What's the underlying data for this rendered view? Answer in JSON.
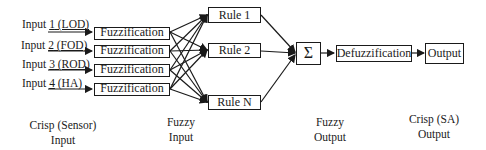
{
  "inputs": [
    {
      "prefix": "Input ",
      "num": "1",
      "tag": " (LOD)"
    },
    {
      "prefix": "Input ",
      "num": "2",
      "tag": " (FOD)"
    },
    {
      "prefix": "Input ",
      "num": "3",
      "tag": " (ROD)"
    },
    {
      "prefix": "Input ",
      "num": "4",
      "tag": " (HA)"
    }
  ],
  "fuzzification": [
    "Fuzzification",
    "Fuzzification",
    "Fuzzification",
    "Fuzzification"
  ],
  "rules": [
    "Rule 1",
    "Rule 2",
    "Rule N"
  ],
  "sum_symbol": "Σ",
  "defuzzification": "Defuzzification",
  "output": "Output",
  "captions": {
    "crisp_input_1": "Crisp (Sensor)",
    "crisp_input_2": "Input",
    "fuzzy_input_1": "Fuzzy",
    "fuzzy_input_2": "Input",
    "fuzzy_output_1": "Fuzzy",
    "fuzzy_output_2": "Output",
    "crisp_output_1": "Crisp (SA)",
    "crisp_output_2": "Output"
  }
}
